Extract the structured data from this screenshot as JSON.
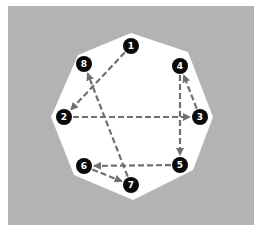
{
  "diagram": {
    "type": "directed-graph",
    "background_color": "#b3b3b3",
    "shape_fill": "#ffffff",
    "node_fill": "#0a0a0a",
    "node_text_color": "#ffffff",
    "edge_color": "#707070",
    "edge_style": "dashed",
    "panel": {
      "x": 8,
      "y": 6,
      "width": 246,
      "height": 219
    },
    "octagon": [
      [
        131,
        33
      ],
      [
        188,
        52
      ],
      [
        213,
        117
      ],
      [
        193,
        170
      ],
      [
        133,
        200
      ],
      [
        74,
        175
      ],
      [
        51,
        117
      ],
      [
        78,
        55
      ]
    ],
    "nodes": [
      {
        "id": "1",
        "label": "1",
        "x": 131,
        "y": 46
      },
      {
        "id": "2",
        "label": "2",
        "x": 64,
        "y": 117
      },
      {
        "id": "3",
        "label": "3",
        "x": 200,
        "y": 117
      },
      {
        "id": "4",
        "label": "4",
        "x": 180,
        "y": 66
      },
      {
        "id": "5",
        "label": "5",
        "x": 180,
        "y": 165
      },
      {
        "id": "6",
        "label": "6",
        "x": 84,
        "y": 166
      },
      {
        "id": "7",
        "label": "7",
        "x": 131,
        "y": 185
      },
      {
        "id": "8",
        "label": "8",
        "x": 84,
        "y": 64
      }
    ],
    "edges": [
      {
        "from": "1",
        "to": "2"
      },
      {
        "from": "2",
        "to": "3"
      },
      {
        "from": "3",
        "to": "4"
      },
      {
        "from": "4",
        "to": "5"
      },
      {
        "from": "5",
        "to": "6"
      },
      {
        "from": "6",
        "to": "7"
      },
      {
        "from": "7",
        "to": "8"
      }
    ]
  }
}
